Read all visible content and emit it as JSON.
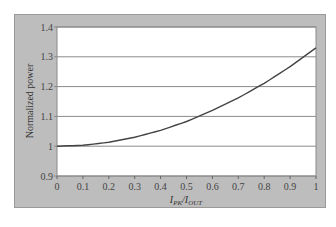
{
  "chart_data": {
    "type": "line",
    "title": "",
    "xlabel": "I_PK/I_OUT",
    "xlabel_main": "I",
    "xlabel_sub1": "PK",
    "xlabel_sep": "/I",
    "xlabel_sub2": "OUT",
    "ylabel": "Normalized power",
    "xlim": [
      0,
      1
    ],
    "ylim": [
      0.9,
      1.4
    ],
    "x_ticks": [
      "0",
      "0.1",
      "0.2",
      "0.3",
      "0.4",
      "0.5",
      "0.6",
      "0.7",
      "0.8",
      "0.9",
      "1"
    ],
    "y_ticks": [
      "0.9",
      "1",
      "1.1",
      "1.2",
      "1.3",
      "1.4"
    ],
    "grid": "horizontal",
    "legend": null,
    "series": [
      {
        "name": "Normalized power",
        "x": [
          0,
          0.1,
          0.2,
          0.3,
          0.4,
          0.5,
          0.6,
          0.7,
          0.8,
          0.9,
          1.0
        ],
        "values": [
          1.0,
          1.003,
          1.013,
          1.03,
          1.053,
          1.083,
          1.12,
          1.162,
          1.211,
          1.267,
          1.33
        ]
      }
    ],
    "colors": {
      "frame": "#bdbdbd",
      "plot_bg": "#ffffff",
      "grid": "#8a8a8a",
      "line": "#444444"
    }
  }
}
